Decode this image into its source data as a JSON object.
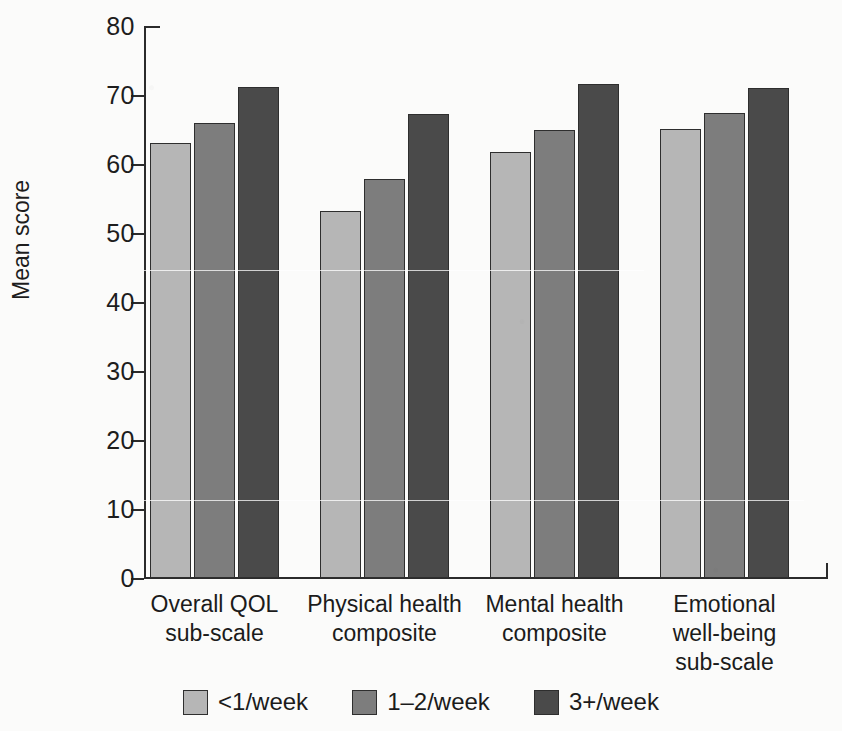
{
  "figure": {
    "background": "#fbfbfa",
    "cropped_top_text": "",
    "width": 842,
    "height": 731
  },
  "axis": {
    "y_title": "Mean score",
    "y_ticks": [
      "80",
      "70",
      "60",
      "50",
      "40",
      "30",
      "20",
      "10",
      "0"
    ]
  },
  "legend": {
    "items": [
      {
        "label": "<1/week",
        "color": "#b6b6b6"
      },
      {
        "label": "1–2/week",
        "color": "#7d7d7d"
      },
      {
        "label": "3+/week",
        "color": "#4a4a4a"
      }
    ]
  },
  "chart_data": {
    "type": "bar",
    "title": "",
    "xlabel": "",
    "ylabel": "Mean score",
    "ylim": [
      0,
      80
    ],
    "ytick_step": 10,
    "grid": false,
    "legend_position": "bottom",
    "categories": [
      "Overall QOL\nsub-scale",
      "Physical health\ncomposite",
      "Mental health\ncomposite",
      "Emotional\nwell-being\nsub-scale"
    ],
    "series": [
      {
        "name": "<1/week",
        "color": "#b6b6b6",
        "values": [
          63.0,
          53.2,
          61.8,
          65.1
        ]
      },
      {
        "name": "1–2/week",
        "color": "#7d7d7d",
        "values": [
          66.0,
          57.9,
          65.0,
          67.4
        ]
      },
      {
        "name": "3+/week",
        "color": "#4a4a4a",
        "values": [
          71.2,
          67.3,
          71.6,
          71.0
        ]
      }
    ]
  }
}
